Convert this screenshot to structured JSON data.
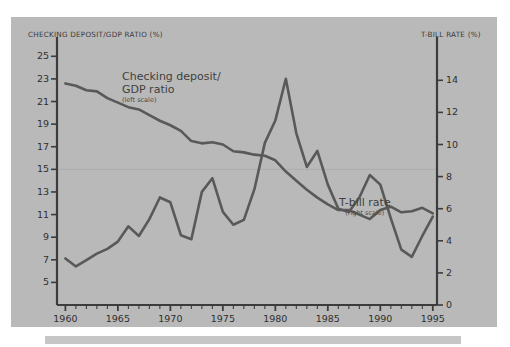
{
  "figure": {
    "background_color": "#ffffff",
    "panel_color": "#b9b9b9",
    "line_color": "#595959",
    "footer_bar_color": "#c6c6c6"
  },
  "chart_data": {
    "type": "line",
    "title": "",
    "xlabel": "",
    "grid": "single faint horizontal gridline at left-scale value 15",
    "legend_position": "inline annotations",
    "x": [
      1960,
      1961,
      1962,
      1963,
      1964,
      1965,
      1966,
      1967,
      1968,
      1969,
      1970,
      1971,
      1972,
      1973,
      1974,
      1975,
      1976,
      1977,
      1978,
      1979,
      1980,
      1981,
      1982,
      1983,
      1984,
      1985,
      1986,
      1987,
      1988,
      1989,
      1990,
      1991,
      1992,
      1993,
      1994,
      1995
    ],
    "xlim": [
      1959.2,
      1995.4
    ],
    "xticks": [
      1960,
      1965,
      1970,
      1975,
      1980,
      1985,
      1990,
      1995
    ],
    "xtick_labels": [
      "1960",
      "1965",
      "1970",
      "1975",
      "1980",
      "1985",
      "1990",
      "1995"
    ],
    "x_minor_tick_interval": 1,
    "axes": [
      {
        "id": "left",
        "title": "CHECKING DEPOSIT/GDP RATIO (%)",
        "ylim": [
          3.0,
          26.0
        ],
        "yticks": [
          5,
          7,
          9,
          11,
          13,
          15,
          17,
          19,
          21,
          23,
          25
        ],
        "ytick_labels": [
          "5",
          "7",
          "9",
          "11",
          "13",
          "15",
          "17",
          "19",
          "21",
          "23",
          "25"
        ]
      },
      {
        "id": "right",
        "title": "T-BILL RATE (%)",
        "ylim": [
          0.0,
          16.2
        ],
        "yticks": [
          0,
          2,
          4,
          6,
          8,
          10,
          12,
          14
        ],
        "ytick_labels": [
          "0",
          "2",
          "4",
          "6",
          "8",
          "10",
          "12",
          "14"
        ]
      }
    ],
    "series": [
      {
        "name": "Checking deposit/GDP ratio",
        "axis": "left",
        "scale_note": "(left scale)",
        "annotation_lines": [
          "Checking deposit/",
          "GDP ratio"
        ],
        "values": [
          22.6,
          22.4,
          22.0,
          21.9,
          21.3,
          20.9,
          20.5,
          20.3,
          19.8,
          19.3,
          18.9,
          18.4,
          17.5,
          17.3,
          17.4,
          17.2,
          16.6,
          16.5,
          16.3,
          16.2,
          15.8,
          14.8,
          14.0,
          13.2,
          12.5,
          11.9,
          11.4,
          11.4,
          11.0,
          10.6,
          11.4,
          11.7,
          11.2,
          11.3,
          11.6,
          11.1
        ]
      },
      {
        "name": "T-bill rate",
        "axis": "right",
        "scale_note": "(right scale)",
        "annotation_lines": [
          "T-bill rate"
        ],
        "values": [
          2.9,
          2.4,
          2.8,
          3.2,
          3.5,
          3.95,
          4.9,
          4.3,
          5.35,
          6.7,
          6.4,
          4.35,
          4.1,
          7.05,
          7.9,
          5.8,
          5.0,
          5.3,
          7.2,
          10.1,
          11.5,
          14.1,
          10.7,
          8.6,
          9.6,
          7.5,
          6.0,
          5.8,
          6.7,
          8.1,
          7.5,
          5.4,
          3.45,
          3.0,
          4.3,
          5.5
        ]
      }
    ]
  },
  "annotations": {
    "deposit_note_main": "Checking deposit/",
    "deposit_note_main2": "GDP ratio",
    "deposit_note_sub": "(left scale)",
    "tbill_note_main": "T-bill rate",
    "tbill_note_sub": "(right scale)"
  }
}
